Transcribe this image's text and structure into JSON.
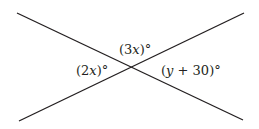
{
  "diagram": {
    "line_color": "#231f20",
    "angles": [
      {
        "position": "top",
        "open": "(",
        "var": "3x",
        "close": ")°"
      },
      {
        "position": "left",
        "open": "(",
        "var": "2x",
        "close": ")°"
      },
      {
        "position": "right",
        "open": "(",
        "var": "y",
        "rest": " + 30)°"
      }
    ],
    "labels": {
      "top": {
        "num": "3",
        "var": "x"
      },
      "left": {
        "num": "2",
        "var": "x"
      },
      "right": {
        "var": "y",
        "rest": " + 30"
      }
    }
  }
}
